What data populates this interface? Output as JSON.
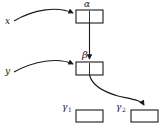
{
  "figure": {
    "type": "node-and-arrow diagram",
    "background_color": "#ffffff",
    "stroke_color": "#1a1a1a",
    "box_fill": "#ffffff"
  },
  "labels": {
    "alpha": "α",
    "beta": "β",
    "x": "x",
    "y": "y",
    "gamma": "γ",
    "gamma1_sub": "1",
    "gamma2_sub": "2"
  },
  "nodes": [
    {
      "id": "box-alpha",
      "label": "α",
      "label_position": "above",
      "x": 76,
      "y": 10,
      "width": 27,
      "height": 13,
      "has_internal_divider": true
    },
    {
      "id": "box-beta",
      "label": "β",
      "label_position": "above",
      "x": 76,
      "y": 62,
      "width": 27,
      "height": 13,
      "has_internal_divider": true
    },
    {
      "id": "box-gamma1",
      "label": "γ₁",
      "label_position": "left",
      "x": 76,
      "y": 110,
      "width": 27,
      "height": 12,
      "has_internal_divider": false
    },
    {
      "id": "box-gamma2",
      "label": "γ₂",
      "label_position": "left",
      "x": 131,
      "y": 110,
      "width": 27,
      "height": 12,
      "has_internal_divider": false
    }
  ],
  "edges": [
    {
      "id": "edge-x-to-alpha",
      "from": "x",
      "to": "box-alpha",
      "style": "curved",
      "arrowhead": true
    },
    {
      "id": "edge-alpha-to-beta",
      "from": "box-alpha",
      "to": "box-beta",
      "style": "straight-vertical",
      "arrowhead": true
    },
    {
      "id": "edge-y-to-beta",
      "from": "y",
      "to": "box-beta",
      "style": "curved",
      "arrowhead": true
    },
    {
      "id": "edge-beta-to-gamma2",
      "from": "box-beta",
      "to": "box-gamma2",
      "style": "s-curve",
      "arrowhead": true
    }
  ]
}
